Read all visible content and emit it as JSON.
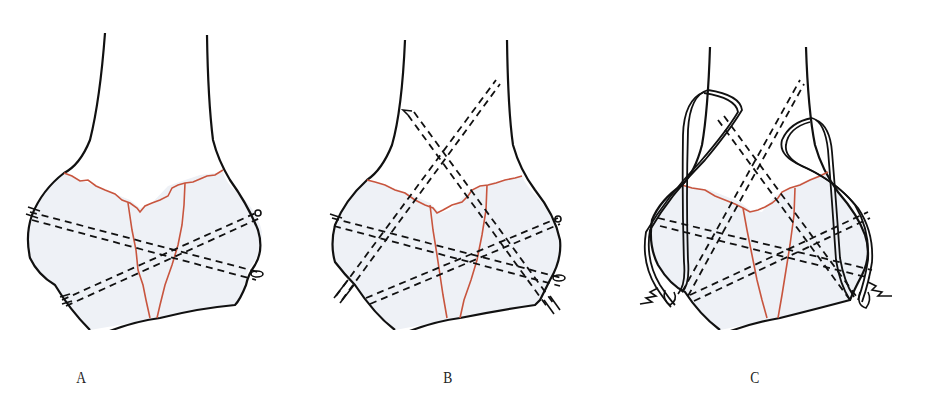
{
  "figure": {
    "colors": {
      "outline": "#111111",
      "fracture": "#c8553e",
      "bone_fill": "#eef1f6",
      "background": "#ffffff"
    },
    "panels": [
      {
        "label": "A",
        "depiction": "distal-humerus-fracture-transverse-pins"
      },
      {
        "label": "B",
        "depiction": "distal-humerus-fracture-transverse-and-crossed-pins"
      },
      {
        "label": "C",
        "depiction": "distal-humerus-fracture-crossed-pins-with-tension-band-wiring"
      }
    ]
  }
}
